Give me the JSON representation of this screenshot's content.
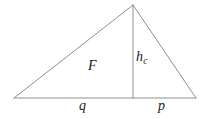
{
  "figure": {
    "kind": "geometry-diagram",
    "width": 207,
    "height": 119,
    "background_color": "#ffffff",
    "stroke_color": "#8f8f8f",
    "stroke_width": 1,
    "text_color": "#1a1a1a"
  },
  "geometry": {
    "vertices": {
      "left": {
        "label": "A",
        "x": 14,
        "y": 98
      },
      "apex": {
        "label": "C",
        "x": 133,
        "y": 5
      },
      "right": {
        "label": "B",
        "x": 196,
        "y": 98
      },
      "foot": {
        "label": "H",
        "x": 133,
        "y": 98
      }
    },
    "segments": [
      {
        "name": "left-side",
        "from": "left",
        "to": "apex"
      },
      {
        "name": "right-side",
        "from": "apex",
        "to": "right"
      },
      {
        "name": "base",
        "from": "left",
        "to": "right"
      },
      {
        "name": "altitude",
        "from": "apex",
        "to": "foot"
      }
    ]
  },
  "labels": {
    "area": {
      "text": "F",
      "sub": "",
      "x": 93,
      "y": 67
    },
    "altitude": {
      "text": "h",
      "sub": "c",
      "x": 137,
      "y": 62
    },
    "base_left": {
      "text": "q",
      "sub": "",
      "x": 83,
      "y": 107
    },
    "base_right": {
      "text": "p",
      "sub": "",
      "x": 162,
      "y": 107
    }
  }
}
